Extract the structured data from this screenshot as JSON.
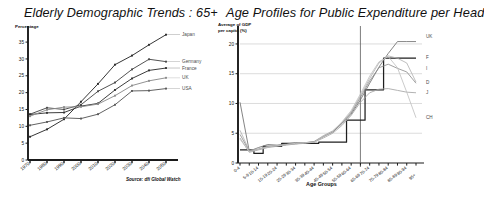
{
  "page": {
    "background": "#ffffff",
    "width": 448,
    "height": 200
  },
  "left_panel": {
    "title": "Elderly Demographic Trends : 65+",
    "y_caption": "Percentage",
    "source": "Source: dfi Global Watch"
  },
  "right_panel": {
    "title": "Age Profiles for Public Expenditure per Head",
    "y_caption_line1": "Average of GDP",
    "y_caption_line2": "per capita (%)",
    "x_axis_title": "Age Groups"
  },
  "chart_data": [
    {
      "id": "elderly-demographic-trends",
      "type": "line",
      "title": "Elderly Demographic Trends : 65+",
      "xlabel": "",
      "ylabel": "Percentage",
      "categories": [
        "1970",
        "1980",
        "1990",
        "2000",
        "2010",
        "2020",
        "2030",
        "2040",
        "2050"
      ],
      "xlim": [
        1970,
        2050
      ],
      "ylim": [
        0,
        38
      ],
      "yticks": [
        0,
        5,
        10,
        15,
        20,
        25,
        30,
        35
      ],
      "grid": false,
      "markers": true,
      "legend": "right-inline",
      "annotation": "Source: dfi Global Watch",
      "series": [
        {
          "name": "Japan",
          "color": "#2b2b2b",
          "values": [
            6.9,
            9.1,
            12.1,
            17.3,
            22.6,
            28.3,
            31.0,
            34.2,
            37.2
          ]
        },
        {
          "name": "Germany",
          "color": "#4a4a4a",
          "values": [
            13.6,
            15.5,
            15.0,
            16.4,
            20.4,
            23.0,
            26.9,
            29.9,
            29.2
          ]
        },
        {
          "name": "France",
          "color": "#333333",
          "values": [
            13.5,
            14.0,
            14.1,
            16.0,
            16.8,
            20.8,
            24.2,
            26.6,
            27.3
          ]
        },
        {
          "name": "UK",
          "color": "#8c8c8c",
          "values": [
            13.0,
            14.9,
            15.7,
            15.8,
            16.6,
            19.1,
            22.1,
            23.5,
            24.4
          ]
        },
        {
          "name": "USA",
          "color": "#5a5a5a",
          "values": [
            10.3,
            11.3,
            12.5,
            12.3,
            13.6,
            16.4,
            20.5,
            20.6,
            21.2
          ]
        }
      ]
    },
    {
      "id": "age-profiles-public-expenditure",
      "type": "line",
      "title": "Age Profiles for Public Expenditure per Head",
      "xlabel": "Age Groups",
      "ylabel": "Average of GDP per capita (%)",
      "categories": [
        "0-4",
        "5-9",
        "10-14",
        "15-19",
        "20-24",
        "25-29",
        "30-34",
        "35-39",
        "40-44",
        "45-49",
        "50-54",
        "55-59",
        "60-64",
        "65-69",
        "70-74",
        "75-79",
        "80-84",
        "85-89",
        "90-94",
        "95+"
      ],
      "ylim": [
        0,
        21
      ],
      "yticks": [
        0,
        5,
        10,
        15,
        20
      ],
      "grid": true,
      "markers": false,
      "reference_line_x": "65-69",
      "legend": "right-inline",
      "series": [
        {
          "name": "UK",
          "color": "#1f1f1f",
          "step": true,
          "values": [
            2.2,
            2.2,
            1.6,
            2.8,
            2.8,
            3.3,
            3.3,
            3.3,
            3.3,
            3.5,
            3.5,
            3.5,
            7.2,
            7.2,
            12.3,
            12.3,
            17.6,
            17.6,
            17.6,
            17.6
          ]
        },
        {
          "name": "F",
          "color": "#6f6f6f",
          "step": false,
          "values": [
            10.2,
            2.0,
            2.6,
            3.1,
            3.0,
            3.2,
            3.4,
            3.4,
            3.5,
            4.5,
            5.2,
            6.6,
            8.2,
            10.6,
            13.4,
            16.1,
            18.4,
            20.4,
            20.4,
            20.4
          ]
        },
        {
          "name": "I",
          "color": "#b4b4b4",
          "step": false,
          "values": [
            5.5,
            2.1,
            2.4,
            2.8,
            2.9,
            3.1,
            3.3,
            3.4,
            3.6,
            4.6,
            5.4,
            6.8,
            8.6,
            11.3,
            14.2,
            16.8,
            18.0,
            17.6,
            16.8,
            13.6
          ]
        },
        {
          "name": "D",
          "color": "#8f8f8f",
          "step": false,
          "values": [
            4.8,
            2.0,
            2.3,
            2.7,
            2.9,
            3.1,
            3.2,
            3.4,
            3.6,
            4.4,
            5.3,
            6.7,
            8.4,
            11.0,
            13.8,
            16.0,
            16.6,
            15.9,
            15.3,
            13.4
          ]
        },
        {
          "name": "J",
          "color": "#a5a5a5",
          "step": false,
          "values": [
            4.2,
            1.8,
            2.2,
            2.6,
            2.8,
            3.0,
            3.2,
            3.3,
            3.5,
            4.2,
            5.0,
            6.3,
            8.0,
            10.2,
            11.8,
            12.4,
            12.5,
            12.2,
            11.9,
            11.8
          ]
        },
        {
          "name": "CH",
          "color": "#c2c2c2",
          "step": false,
          "values": [
            4.0,
            1.9,
            2.3,
            2.7,
            2.9,
            3.1,
            3.3,
            3.4,
            3.5,
            4.5,
            5.3,
            6.9,
            8.8,
            11.6,
            14.6,
            17.0,
            17.9,
            16.0,
            11.9,
            7.6
          ]
        }
      ]
    }
  ]
}
